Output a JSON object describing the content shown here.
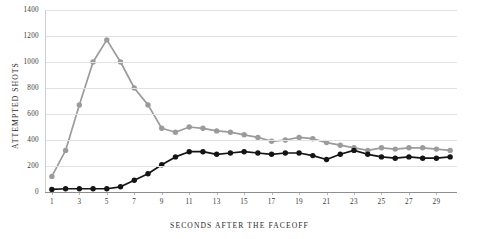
{
  "chart_data": {
    "type": "line",
    "title": "",
    "xlabel": "SECONDS AFTER THE FACEOFF",
    "ylabel": "ATTEMPTED SHOTS",
    "xlim": [
      0.5,
      30.5
    ],
    "ylim": [
      0,
      1400
    ],
    "yticks": [
      0,
      200,
      400,
      600,
      800,
      1000,
      1200,
      1400
    ],
    "ytick_labels": [
      "0",
      "200",
      "400",
      "600",
      "800",
      "1000",
      "1200",
      "1400"
    ],
    "xticks": [
      1,
      3,
      5,
      7,
      9,
      11,
      13,
      15,
      17,
      19,
      21,
      23,
      25,
      27,
      29
    ],
    "xtick_labels": [
      "1",
      "3",
      "5",
      "7",
      "9",
      "11",
      "13",
      "15",
      "17",
      "19",
      "21",
      "23",
      "25",
      "27",
      "29"
    ],
    "grid": "horizontal",
    "legend": "none",
    "x": [
      1,
      2,
      3,
      4,
      5,
      6,
      7,
      8,
      9,
      10,
      11,
      12,
      13,
      14,
      15,
      16,
      17,
      18,
      19,
      20,
      21,
      22,
      23,
      24,
      25,
      26,
      27,
      28,
      29,
      30
    ],
    "series": [
      {
        "name": "gray-series",
        "color": "#9b9b9b",
        "marker": "circle",
        "values": [
          120,
          320,
          670,
          1000,
          1170,
          1000,
          800,
          670,
          490,
          460,
          500,
          490,
          470,
          460,
          440,
          420,
          390,
          400,
          420,
          410,
          380,
          360,
          340,
          320,
          340,
          330,
          340,
          340,
          330,
          320
        ]
      },
      {
        "name": "black-series",
        "color": "#141414",
        "marker": "circle",
        "values": [
          20,
          25,
          25,
          25,
          25,
          40,
          90,
          140,
          210,
          270,
          310,
          310,
          290,
          300,
          310,
          300,
          290,
          300,
          300,
          280,
          250,
          290,
          320,
          290,
          270,
          260,
          270,
          260,
          260,
          270
        ]
      }
    ]
  }
}
